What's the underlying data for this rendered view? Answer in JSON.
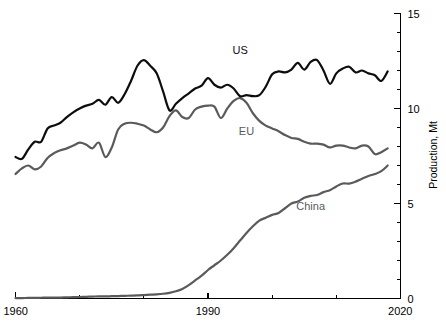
{
  "chart_data": {
    "type": "line",
    "title": "",
    "xlabel": "",
    "ylabel": "Production, Mt",
    "xlim": [
      1960,
      2020
    ],
    "ylim": [
      0,
      15
    ],
    "x_ticks": [
      1960,
      1990,
      2020
    ],
    "x_tick_labels": [
      "1960",
      "1990",
      "2020"
    ],
    "x_minor_ticks": [
      1970,
      1980,
      2000,
      2010
    ],
    "y_ticks": [
      0,
      5,
      10,
      15
    ],
    "y_tick_labels": [
      "0",
      "5",
      "10",
      "15"
    ],
    "y_minor_ticks": [
      1,
      2,
      3,
      4,
      6,
      7,
      8,
      9,
      11,
      12,
      13,
      14
    ],
    "grid": false,
    "legend_position": "inline-labels",
    "axes_position": {
      "x_axis": "bottom",
      "y_axis": "right"
    },
    "series": [
      {
        "name": "US",
        "color": "#0d0d0d",
        "label": "US",
        "label_x": 1995,
        "label_y": 12.85,
        "x": [
          1960,
          1961,
          1962,
          1963,
          1964,
          1965,
          1966,
          1967,
          1968,
          1969,
          1970,
          1971,
          1972,
          1973,
          1974,
          1975,
          1976,
          1977,
          1978,
          1979,
          1980,
          1981,
          1982,
          1983,
          1984,
          1985,
          1986,
          1987,
          1988,
          1989,
          1990,
          1991,
          1992,
          1993,
          1994,
          1995,
          1996,
          1997,
          1998,
          1999,
          2000,
          2001,
          2002,
          2003,
          2004,
          2005,
          2006,
          2007,
          2008,
          2009,
          2010,
          2011,
          2012,
          2013,
          2014,
          2015,
          2016,
          2017,
          2018
        ],
        "y": [
          7.45,
          7.35,
          7.85,
          8.25,
          8.25,
          8.95,
          9.1,
          9.25,
          9.55,
          9.8,
          10.0,
          10.15,
          10.25,
          10.45,
          10.2,
          10.6,
          10.3,
          10.75,
          11.45,
          12.25,
          12.55,
          12.25,
          11.85,
          10.9,
          9.9,
          10.25,
          10.55,
          10.8,
          11.05,
          11.2,
          11.6,
          11.25,
          11.1,
          11.25,
          11.05,
          10.65,
          10.7,
          10.65,
          10.7,
          11.15,
          11.8,
          11.95,
          11.9,
          12.05,
          12.4,
          12.05,
          12.45,
          12.55,
          12.0,
          11.3,
          11.85,
          12.1,
          12.2,
          11.9,
          12.0,
          11.85,
          11.75,
          11.45,
          11.95
        ],
        "stroke_width": 2.2
      },
      {
        "name": "EU",
        "color": "#5a5a5a",
        "label": "EU",
        "label_x": 1996,
        "label_y": 8.6,
        "x": [
          1960,
          1961,
          1962,
          1963,
          1964,
          1965,
          1966,
          1967,
          1968,
          1969,
          1970,
          1971,
          1972,
          1973,
          1974,
          1975,
          1976,
          1977,
          1978,
          1979,
          1980,
          1981,
          1982,
          1983,
          1984,
          1985,
          1986,
          1987,
          1988,
          1989,
          1990,
          1991,
          1992,
          1993,
          1994,
          1995,
          1996,
          1997,
          1998,
          1999,
          2000,
          2001,
          2002,
          2003,
          2004,
          2005,
          2006,
          2007,
          2008,
          2009,
          2010,
          2011,
          2012,
          2013,
          2014,
          2015,
          2016,
          2017,
          2018
        ],
        "y": [
          6.55,
          6.85,
          7.0,
          6.8,
          6.95,
          7.4,
          7.65,
          7.8,
          7.9,
          8.05,
          8.2,
          8.1,
          7.9,
          8.2,
          7.45,
          7.95,
          8.9,
          9.2,
          9.25,
          9.2,
          9.1,
          8.9,
          8.75,
          9.0,
          9.6,
          9.9,
          9.55,
          9.5,
          9.95,
          10.1,
          10.15,
          10.1,
          9.5,
          10.0,
          10.4,
          10.55,
          10.3,
          9.75,
          9.35,
          9.1,
          8.95,
          8.8,
          8.6,
          8.45,
          8.4,
          8.25,
          8.15,
          8.15,
          8.1,
          7.95,
          8.05,
          8.05,
          7.95,
          7.9,
          8.05,
          8.0,
          7.6,
          7.7,
          7.9
        ],
        "stroke_width": 2.2
      },
      {
        "name": "China",
        "color": "#5a5a5a",
        "label": "China",
        "label_x": 2006,
        "label_y": 4.65,
        "x": [
          1960,
          1961,
          1962,
          1963,
          1964,
          1965,
          1966,
          1967,
          1968,
          1969,
          1970,
          1971,
          1972,
          1973,
          1974,
          1975,
          1976,
          1977,
          1978,
          1979,
          1980,
          1981,
          1982,
          1983,
          1984,
          1985,
          1986,
          1987,
          1988,
          1989,
          1990,
          1991,
          1992,
          1993,
          1994,
          1995,
          1996,
          1997,
          1998,
          1999,
          2000,
          2001,
          2002,
          2003,
          2004,
          2005,
          2006,
          2007,
          2008,
          2009,
          2010,
          2011,
          2012,
          2013,
          2014,
          2015,
          2016,
          2017,
          2018
        ],
        "y": [
          0.02,
          0.02,
          0.03,
          0.03,
          0.04,
          0.05,
          0.05,
          0.05,
          0.06,
          0.07,
          0.08,
          0.09,
          0.1,
          0.11,
          0.11,
          0.12,
          0.13,
          0.14,
          0.15,
          0.16,
          0.18,
          0.2,
          0.22,
          0.25,
          0.3,
          0.38,
          0.5,
          0.7,
          0.95,
          1.2,
          1.5,
          1.75,
          2.0,
          2.3,
          2.65,
          3.05,
          3.45,
          3.8,
          4.1,
          4.25,
          4.4,
          4.5,
          4.75,
          5.0,
          5.1,
          5.3,
          5.4,
          5.45,
          5.6,
          5.7,
          5.9,
          6.05,
          6.05,
          6.15,
          6.3,
          6.45,
          6.55,
          6.7,
          7.0
        ],
        "stroke_width": 2.2
      }
    ]
  },
  "axes": {
    "y_axis_title": "Production, Mt",
    "x_start_label": "1960",
    "x_mid_label": "1990",
    "x_end_label": "2020",
    "y_0": "0",
    "y_5": "5",
    "y_10": "10",
    "y_15": "15"
  },
  "colors": {
    "us_line": "#0d0d0d",
    "eu_line": "#5a5a5a",
    "china_line": "#5a5a5a",
    "axis": "#000000",
    "background": "#ffffff"
  }
}
